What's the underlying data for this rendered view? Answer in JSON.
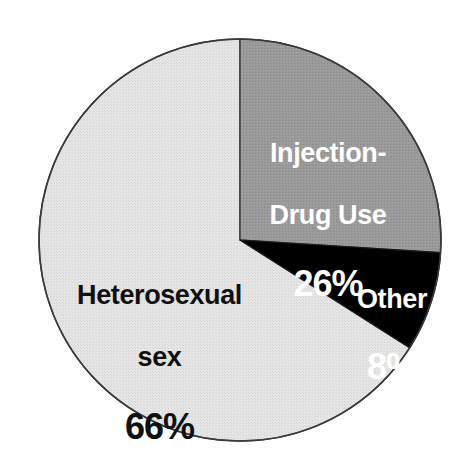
{
  "chart_data": {
    "type": "pie",
    "title": "",
    "subtitle": "",
    "xlabel": "",
    "ylabel": "",
    "legend_position": "none",
    "grid": false,
    "units": "percent",
    "start_angle_deg": 0,
    "direction": "clockwise",
    "categories": [
      "Injection-Drug Use",
      "Other",
      "Heterosexual sex"
    ],
    "values": [
      26,
      8,
      66
    ],
    "slices": [
      {
        "label": "Injection-Drug Use",
        "label_line1": "Injection-",
        "label_line2": "Drug Use",
        "value": 26,
        "value_text": "26%",
        "color": "#999999",
        "text_color": "#ffffff",
        "start_angle_deg": 0,
        "end_angle_deg": 93.6
      },
      {
        "label": "Other",
        "label_line1": "Other",
        "label_line2": "",
        "value": 8,
        "value_text": "8%",
        "color": "#000000",
        "text_color": "#ffffff",
        "start_angle_deg": 93.6,
        "end_angle_deg": 122.4
      },
      {
        "label": "Heterosexual sex",
        "label_line1": "Heterosexual",
        "label_line2": "sex",
        "value": 66,
        "value_text": "66%",
        "color": "#e2e2e2",
        "text_color": "#101010",
        "start_angle_deg": 122.4,
        "end_angle_deg": 360
      }
    ]
  },
  "figure": {
    "background_color": "#ffffff",
    "outline_color": "#3a3a3a",
    "center_x": 240,
    "center_y": 240,
    "radius": 201
  }
}
